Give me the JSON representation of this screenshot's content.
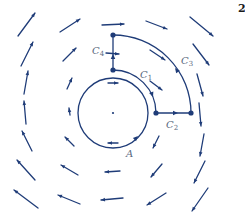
{
  "figure": {
    "number": "2",
    "color": "#1f3c78",
    "center": [
      113,
      113
    ],
    "labels": {
      "A": {
        "text": "A",
        "x": 126,
        "y": 157
      },
      "C1": {
        "text": "C",
        "sub": "1",
        "x": 140,
        "y": 78
      },
      "C2": {
        "text": "C",
        "sub": "2",
        "x": 166,
        "y": 128
      },
      "C3": {
        "text": "C",
        "sub": "3",
        "x": 181,
        "y": 64
      },
      "C4": {
        "text": "C",
        "sub": "4",
        "x": 92,
        "y": 54
      }
    },
    "curves": {
      "A": {
        "type": "circle",
        "cx": 113,
        "cy": 113,
        "r": 35,
        "arrow_at": [
          138,
          136
        ],
        "arrow_dir": [
          0.7,
          -0.7
        ]
      },
      "C1": {
        "type": "arc",
        "cx": 113,
        "cy": 113,
        "r": 43,
        "from_deg": -90,
        "to_deg": 0,
        "arrow_at": [
          153,
          97
        ],
        "arrow_dir": [
          0.35,
          0.94
        ]
      },
      "C2": {
        "type": "segment",
        "from": [
          156,
          113
        ],
        "to": [
          191,
          113
        ],
        "arrow_at": [
          178,
          113
        ],
        "arrow_dir": [
          1,
          0
        ]
      },
      "C3": {
        "type": "arc",
        "cx": 113,
        "cy": 113,
        "r": 78,
        "from_deg": -90,
        "to_deg": 0,
        "arrow_at": [
          175,
          68
        ],
        "arrow_dir": [
          -0.6,
          -0.8
        ]
      },
      "C4": {
        "type": "segment",
        "from": [
          113,
          70
        ],
        "to": [
          113,
          35
        ],
        "arrow_at": [
          113,
          54
        ],
        "arrow_dir": [
          0,
          -1
        ]
      }
    },
    "vertices": [
      [
        113,
        35
      ],
      [
        113,
        70
      ],
      [
        156,
        113
      ],
      [
        191,
        113
      ]
    ],
    "center_dot": [
      113,
      113
    ],
    "vector_field": [
      {
        "x1": 18,
        "y1": 36,
        "x2": 35,
        "y2": 13
      },
      {
        "x1": 60,
        "y1": 32,
        "x2": 80,
        "y2": 19
      },
      {
        "x1": 102,
        "y1": 25,
        "x2": 124,
        "y2": 24
      },
      {
        "x1": 146,
        "y1": 21,
        "x2": 167,
        "y2": 29
      },
      {
        "x1": 190,
        "y1": 17,
        "x2": 213,
        "y2": 36
      },
      {
        "x1": 21,
        "y1": 66,
        "x2": 33,
        "y2": 42
      },
      {
        "x1": 63,
        "y1": 61,
        "x2": 76,
        "y2": 48
      },
      {
        "x1": 106,
        "y1": 53,
        "x2": 119,
        "y2": 54
      },
      {
        "x1": 150,
        "y1": 50,
        "x2": 165,
        "y2": 60
      },
      {
        "x1": 193,
        "y1": 44,
        "x2": 209,
        "y2": 65
      },
      {
        "x1": 24,
        "y1": 94,
        "x2": 28,
        "y2": 71
      },
      {
        "x1": 67,
        "y1": 89,
        "x2": 72,
        "y2": 78
      },
      {
        "x1": 108,
        "y1": 83,
        "x2": 118,
        "y2": 83
      },
      {
        "x1": 150,
        "y1": 81,
        "x2": 162,
        "y2": 90
      },
      {
        "x1": 197,
        "y1": 74,
        "x2": 203,
        "y2": 96
      },
      {
        "x1": 26,
        "y1": 124,
        "x2": 24,
        "y2": 101
      },
      {
        "x1": 70,
        "y1": 115,
        "x2": 69,
        "y2": 108
      },
      {
        "x1": 199,
        "y1": 103,
        "x2": 201,
        "y2": 126
      },
      {
        "x1": 32,
        "y1": 151,
        "x2": 22,
        "y2": 131
      },
      {
        "x1": 74,
        "y1": 146,
        "x2": 65,
        "y2": 137
      },
      {
        "x1": 118,
        "y1": 143,
        "x2": 108,
        "y2": 143
      },
      {
        "x1": 159,
        "y1": 136,
        "x2": 153,
        "y2": 148
      },
      {
        "x1": 204,
        "y1": 134,
        "x2": 200,
        "y2": 156
      },
      {
        "x1": 35,
        "y1": 180,
        "x2": 17,
        "y2": 160
      },
      {
        "x1": 78,
        "y1": 175,
        "x2": 61,
        "y2": 165
      },
      {
        "x1": 120,
        "y1": 171,
        "x2": 105,
        "y2": 172
      },
      {
        "x1": 162,
        "y1": 164,
        "x2": 151,
        "y2": 177
      },
      {
        "x1": 205,
        "y1": 161,
        "x2": 194,
        "y2": 183
      },
      {
        "x1": 38,
        "y1": 208,
        "x2": 14,
        "y2": 190
      },
      {
        "x1": 80,
        "y1": 204,
        "x2": 58,
        "y2": 195
      },
      {
        "x1": 123,
        "y1": 198,
        "x2": 101,
        "y2": 200
      },
      {
        "x1": 166,
        "y1": 193,
        "x2": 147,
        "y2": 205
      },
      {
        "x1": 208,
        "y1": 188,
        "x2": 192,
        "y2": 211
      }
    ]
  }
}
